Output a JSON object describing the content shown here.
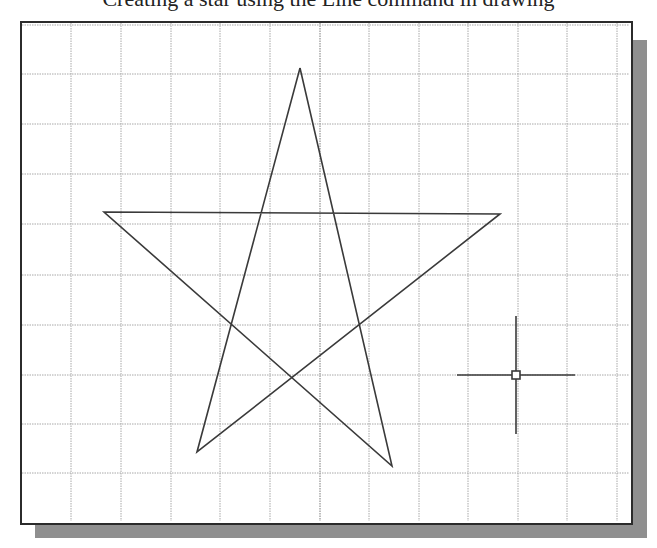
{
  "header": {
    "clipped_caption": "Creating a star using the Line command in drawing"
  },
  "canvas": {
    "background": "#ffffff",
    "border_color": "#2b2b2b",
    "shadow_color": "#8f8f8f",
    "grid": {
      "color": "#a8a8a8",
      "spacing_px": 49.7,
      "vertical_lines_x": [
        71,
        121,
        171,
        220,
        270,
        320,
        369,
        419,
        468,
        518,
        567,
        617
      ],
      "horizontal_lines_y": [
        25,
        74,
        124,
        174,
        224,
        275,
        325,
        375,
        424,
        473
      ]
    },
    "star": {
      "stroke": "#3a3a3a",
      "vertices": [
        [
          300,
          68
        ],
        [
          392,
          466
        ],
        [
          104,
          212
        ],
        [
          500,
          214
        ],
        [
          197,
          452
        ]
      ]
    },
    "cursor": {
      "type": "crosshair-icon",
      "center": [
        516,
        375
      ],
      "h_extent": [
        457,
        575
      ],
      "v_extent": [
        316,
        434
      ],
      "pickbox_size": 8
    }
  }
}
